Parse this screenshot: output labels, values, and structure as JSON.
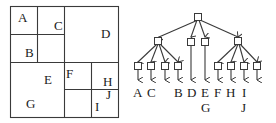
{
  "figure": {
    "type": "region-quadtree-with-tree",
    "quadtree": {
      "regions": [
        {
          "label": "A",
          "x": 18,
          "y": 22
        },
        {
          "label": "C",
          "x": 54,
          "y": 30
        },
        {
          "label": "D",
          "x": 101,
          "y": 38
        },
        {
          "label": "B",
          "x": 25,
          "y": 57
        },
        {
          "label": "E",
          "x": 44,
          "y": 82
        },
        {
          "label": "F",
          "x": 66,
          "y": 78
        },
        {
          "label": "H",
          "x": 104,
          "y": 86
        },
        {
          "label": "J",
          "x": 106,
          "y": 99
        },
        {
          "label": "G",
          "x": 26,
          "y": 108
        },
        {
          "label": "I",
          "x": 94,
          "y": 110
        }
      ]
    },
    "tree": {
      "root": "internal",
      "level1": [
        "internal",
        "D",
        "E/G",
        "internal"
      ],
      "leaves": [
        {
          "label": "A",
          "x": 136
        },
        {
          "label": "C",
          "x": 151
        },
        {
          "label": "",
          "x": 165
        },
        {
          "label": "B",
          "x": 178
        },
        {
          "label": "D",
          "x": 192
        },
        {
          "label": "E",
          "x": 205,
          "sub": "G"
        },
        {
          "label": "F",
          "x": 218
        },
        {
          "label": "H",
          "x": 231
        },
        {
          "label": "I",
          "x": 244,
          "sub": "J"
        },
        {
          "label": "",
          "x": 257
        }
      ]
    }
  },
  "labels": {
    "A": "A",
    "B": "B",
    "C": "C",
    "D": "D",
    "E": "E",
    "F": "F",
    "G": "G",
    "H": "H",
    "I": "I",
    "J": "J"
  }
}
